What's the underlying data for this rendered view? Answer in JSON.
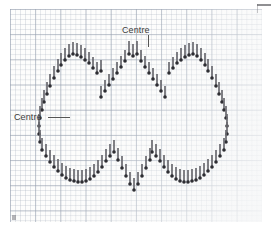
{
  "document": {
    "kind": "cross-stitch-chart",
    "title": "Heart outline backstitch chart on graph paper",
    "background_color": "#fdfdfc",
    "grid": {
      "cell_px": 5.04,
      "bold_every": 5,
      "line_color": "#a8b0be",
      "bold_line_color": "#96a0af",
      "origin_x": 10,
      "origin_y": 9,
      "width_px": 252,
      "height_px": 213
    },
    "stitch_style": {
      "color": "#6a6a70",
      "dot_color": "#2e2e33",
      "stitch_width_px": 2,
      "stitch_length_px": 11,
      "dot_size_px": 3
    }
  },
  "labels": [
    {
      "id": "centre-top",
      "text": "Centre",
      "x": 122,
      "y": 25,
      "leader": {
        "x": 148,
        "y": 35,
        "width": 1,
        "height": 12,
        "orientation": "vertical"
      }
    },
    {
      "id": "centre-left",
      "text": "Centre",
      "x": 14,
      "y": 112,
      "leader": {
        "x": 48,
        "y": 117,
        "width": 22,
        "height": 1,
        "orientation": "horizontal"
      }
    }
  ],
  "chart_data": {
    "type": "scatter",
    "x": [],
    "stitches": [
      {
        "x": 129,
        "y": 41,
        "len": 13,
        "dot": "bottom"
      },
      {
        "x": 133,
        "y": 44,
        "len": 12,
        "dot": "bottom"
      },
      {
        "x": 137,
        "y": 41,
        "len": 13,
        "dot": "bottom"
      },
      {
        "x": 125,
        "y": 50,
        "len": 11,
        "dot": "bottom"
      },
      {
        "x": 141,
        "y": 50,
        "len": 11,
        "dot": "bottom"
      },
      {
        "x": 121,
        "y": 56,
        "len": 11,
        "dot": "bottom"
      },
      {
        "x": 145,
        "y": 56,
        "len": 11,
        "dot": "bottom"
      },
      {
        "x": 117,
        "y": 62,
        "len": 11,
        "dot": "bottom"
      },
      {
        "x": 149,
        "y": 62,
        "len": 11,
        "dot": "bottom"
      },
      {
        "x": 113,
        "y": 68,
        "len": 11,
        "dot": "bottom"
      },
      {
        "x": 153,
        "y": 68,
        "len": 11,
        "dot": "bottom"
      },
      {
        "x": 109,
        "y": 74,
        "len": 11,
        "dot": "bottom"
      },
      {
        "x": 157,
        "y": 74,
        "len": 11,
        "dot": "bottom"
      },
      {
        "x": 105,
        "y": 80,
        "len": 11,
        "dot": "bottom"
      },
      {
        "x": 161,
        "y": 80,
        "len": 11,
        "dot": "bottom"
      },
      {
        "x": 101,
        "y": 86,
        "len": 11,
        "dot": "bottom"
      },
      {
        "x": 165,
        "y": 86,
        "len": 11,
        "dot": "bottom"
      },
      {
        "x": 97,
        "y": 62,
        "len": 11,
        "dot": "bottom"
      },
      {
        "x": 93,
        "y": 57,
        "len": 11,
        "dot": "bottom"
      },
      {
        "x": 89,
        "y": 52,
        "len": 11,
        "dot": "bottom"
      },
      {
        "x": 85,
        "y": 48,
        "len": 12,
        "dot": "bottom"
      },
      {
        "x": 81,
        "y": 45,
        "len": 12,
        "dot": "bottom"
      },
      {
        "x": 77,
        "y": 43,
        "len": 12,
        "dot": "bottom"
      },
      {
        "x": 73,
        "y": 42,
        "len": 12,
        "dot": "bottom"
      },
      {
        "x": 69,
        "y": 44,
        "len": 12,
        "dot": "bottom"
      },
      {
        "x": 65,
        "y": 48,
        "len": 12,
        "dot": "bottom"
      },
      {
        "x": 61,
        "y": 53,
        "len": 12,
        "dot": "bottom"
      },
      {
        "x": 58,
        "y": 59,
        "len": 12,
        "dot": "bottom"
      },
      {
        "x": 101,
        "y": 60,
        "len": 11,
        "dot": "bottom"
      },
      {
        "x": 169,
        "y": 62,
        "len": 11,
        "dot": "bottom"
      },
      {
        "x": 173,
        "y": 57,
        "len": 11,
        "dot": "bottom"
      },
      {
        "x": 177,
        "y": 52,
        "len": 11,
        "dot": "bottom"
      },
      {
        "x": 181,
        "y": 48,
        "len": 12,
        "dot": "bottom"
      },
      {
        "x": 185,
        "y": 45,
        "len": 12,
        "dot": "bottom"
      },
      {
        "x": 189,
        "y": 43,
        "len": 12,
        "dot": "bottom"
      },
      {
        "x": 193,
        "y": 42,
        "len": 12,
        "dot": "bottom"
      },
      {
        "x": 197,
        "y": 44,
        "len": 12,
        "dot": "bottom"
      },
      {
        "x": 201,
        "y": 48,
        "len": 12,
        "dot": "bottom"
      },
      {
        "x": 205,
        "y": 53,
        "len": 12,
        "dot": "bottom"
      },
      {
        "x": 208,
        "y": 59,
        "len": 12,
        "dot": "bottom"
      },
      {
        "x": 54,
        "y": 66,
        "len": 12,
        "dot": "bottom"
      },
      {
        "x": 50,
        "y": 74,
        "len": 12,
        "dot": "bottom"
      },
      {
        "x": 47,
        "y": 82,
        "len": 12,
        "dot": "bottom"
      },
      {
        "x": 44,
        "y": 90,
        "len": 12,
        "dot": "bottom"
      },
      {
        "x": 42,
        "y": 98,
        "len": 12,
        "dot": "bottom"
      },
      {
        "x": 40,
        "y": 106,
        "len": 12,
        "dot": "bottom"
      },
      {
        "x": 39,
        "y": 114,
        "len": 12,
        "dot": "bottom"
      },
      {
        "x": 39,
        "y": 122,
        "len": 12,
        "dot": "bottom"
      },
      {
        "x": 40,
        "y": 130,
        "len": 12,
        "dot": "bottom"
      },
      {
        "x": 42,
        "y": 138,
        "len": 12,
        "dot": "bottom"
      },
      {
        "x": 212,
        "y": 66,
        "len": 12,
        "dot": "bottom"
      },
      {
        "x": 216,
        "y": 74,
        "len": 12,
        "dot": "bottom"
      },
      {
        "x": 219,
        "y": 82,
        "len": 12,
        "dot": "bottom"
      },
      {
        "x": 222,
        "y": 90,
        "len": 12,
        "dot": "bottom"
      },
      {
        "x": 224,
        "y": 98,
        "len": 12,
        "dot": "bottom"
      },
      {
        "x": 226,
        "y": 106,
        "len": 12,
        "dot": "bottom"
      },
      {
        "x": 227,
        "y": 114,
        "len": 12,
        "dot": "bottom"
      },
      {
        "x": 227,
        "y": 122,
        "len": 12,
        "dot": "bottom"
      },
      {
        "x": 226,
        "y": 130,
        "len": 12,
        "dot": "bottom"
      },
      {
        "x": 224,
        "y": 138,
        "len": 12,
        "dot": "bottom"
      },
      {
        "x": 46,
        "y": 144,
        "len": 12,
        "dot": "bottom"
      },
      {
        "x": 50,
        "y": 150,
        "len": 12,
        "dot": "bottom"
      },
      {
        "x": 54,
        "y": 155,
        "len": 12,
        "dot": "bottom"
      },
      {
        "x": 58,
        "y": 159,
        "len": 12,
        "dot": "bottom"
      },
      {
        "x": 62,
        "y": 163,
        "len": 12,
        "dot": "bottom"
      },
      {
        "x": 66,
        "y": 166,
        "len": 12,
        "dot": "bottom"
      },
      {
        "x": 70,
        "y": 168,
        "len": 12,
        "dot": "bottom"
      },
      {
        "x": 74,
        "y": 169,
        "len": 12,
        "dot": "bottom"
      },
      {
        "x": 78,
        "y": 170,
        "len": 12,
        "dot": "bottom"
      },
      {
        "x": 82,
        "y": 170,
        "len": 12,
        "dot": "bottom"
      },
      {
        "x": 86,
        "y": 169,
        "len": 12,
        "dot": "bottom"
      },
      {
        "x": 90,
        "y": 167,
        "len": 12,
        "dot": "bottom"
      },
      {
        "x": 94,
        "y": 164,
        "len": 12,
        "dot": "bottom"
      },
      {
        "x": 98,
        "y": 160,
        "len": 12,
        "dot": "bottom"
      },
      {
        "x": 102,
        "y": 155,
        "len": 12,
        "dot": "bottom"
      },
      {
        "x": 106,
        "y": 149,
        "len": 12,
        "dot": "bottom"
      },
      {
        "x": 110,
        "y": 144,
        "len": 12,
        "dot": "bottom"
      },
      {
        "x": 114,
        "y": 140,
        "len": 12,
        "dot": "bottom"
      },
      {
        "x": 220,
        "y": 144,
        "len": 12,
        "dot": "bottom"
      },
      {
        "x": 216,
        "y": 150,
        "len": 12,
        "dot": "bottom"
      },
      {
        "x": 212,
        "y": 155,
        "len": 12,
        "dot": "bottom"
      },
      {
        "x": 208,
        "y": 159,
        "len": 12,
        "dot": "bottom"
      },
      {
        "x": 204,
        "y": 163,
        "len": 12,
        "dot": "bottom"
      },
      {
        "x": 200,
        "y": 166,
        "len": 12,
        "dot": "bottom"
      },
      {
        "x": 196,
        "y": 168,
        "len": 12,
        "dot": "bottom"
      },
      {
        "x": 192,
        "y": 169,
        "len": 12,
        "dot": "bottom"
      },
      {
        "x": 188,
        "y": 170,
        "len": 12,
        "dot": "bottom"
      },
      {
        "x": 184,
        "y": 170,
        "len": 12,
        "dot": "bottom"
      },
      {
        "x": 180,
        "y": 169,
        "len": 12,
        "dot": "bottom"
      },
      {
        "x": 176,
        "y": 167,
        "len": 12,
        "dot": "bottom"
      },
      {
        "x": 172,
        "y": 164,
        "len": 12,
        "dot": "bottom"
      },
      {
        "x": 168,
        "y": 160,
        "len": 12,
        "dot": "bottom"
      },
      {
        "x": 164,
        "y": 155,
        "len": 12,
        "dot": "bottom"
      },
      {
        "x": 160,
        "y": 149,
        "len": 12,
        "dot": "bottom"
      },
      {
        "x": 156,
        "y": 144,
        "len": 12,
        "dot": "bottom"
      },
      {
        "x": 152,
        "y": 140,
        "len": 12,
        "dot": "bottom"
      },
      {
        "x": 118,
        "y": 148,
        "len": 12,
        "dot": "bottom"
      },
      {
        "x": 122,
        "y": 156,
        "len": 12,
        "dot": "bottom"
      },
      {
        "x": 126,
        "y": 164,
        "len": 12,
        "dot": "bottom"
      },
      {
        "x": 130,
        "y": 172,
        "len": 12,
        "dot": "bottom"
      },
      {
        "x": 134,
        "y": 178,
        "len": 12,
        "dot": "bottom"
      },
      {
        "x": 138,
        "y": 172,
        "len": 12,
        "dot": "bottom"
      },
      {
        "x": 142,
        "y": 164,
        "len": 12,
        "dot": "bottom"
      },
      {
        "x": 146,
        "y": 156,
        "len": 12,
        "dot": "bottom"
      },
      {
        "x": 150,
        "y": 148,
        "len": 12,
        "dot": "bottom"
      }
    ],
    "xlabel": "",
    "ylabel": "",
    "grid": true,
    "legend": false
  }
}
